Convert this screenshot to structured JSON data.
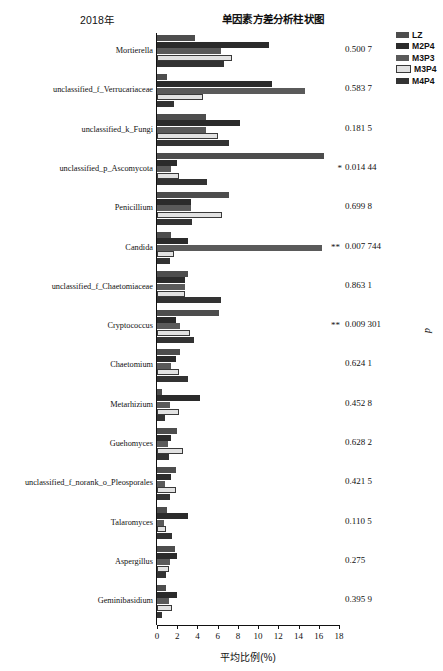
{
  "header": {
    "year": "2018年",
    "title": "单因素方差分析柱状图"
  },
  "legend": {
    "items": [
      {
        "label": "LZ",
        "color": "#4d4d4d"
      },
      {
        "label": "M2P4",
        "color": "#2b2b2b"
      },
      {
        "label": "M3P3",
        "color": "#5a5a5a"
      },
      {
        "label": "M3P4",
        "color": "#e2e2e2"
      },
      {
        "label": "M4P4",
        "color": "#333333"
      }
    ]
  },
  "axis": {
    "xlabel": "平均比例(%)",
    "ticks": [
      "0",
      "2",
      "4",
      "6",
      "8",
      "10",
      "12",
      "14",
      "16",
      "18"
    ],
    "p_axis_label": "p"
  },
  "chart_data": {
    "type": "bar",
    "orientation": "horizontal",
    "title": "单因素方差分析柱状图",
    "subtitle": "2018年",
    "xlabel": "平均比例(%)",
    "ylabel": "",
    "xlim": [
      0,
      18
    ],
    "grid": false,
    "legend_position": "top-right",
    "categories": [
      "Mortierella",
      "unclassified_f_Verrucariaceae",
      "unclassified_k_Fungi",
      "unclassified_p_Ascomycota",
      "Penicillium",
      "Candida",
      "unclassified_f_Chaetomiaceae",
      "Cryptococcus",
      "Chaetomium",
      "Metarhizium",
      "Guehomyces",
      "unclassified_f_norank_o_Pleosporales",
      "Talaromyces",
      "Aspergillus",
      "Geminibasidium"
    ],
    "series": [
      {
        "name": "LZ",
        "values": [
          3.8,
          1.0,
          4.8,
          16.5,
          7.1,
          1.4,
          3.1,
          6.1,
          2.3,
          0.5,
          2.0,
          1.9,
          1.0,
          1.8,
          0.9
        ]
      },
      {
        "name": "M2P4",
        "values": [
          11.1,
          11.4,
          8.2,
          2.0,
          3.4,
          3.1,
          2.8,
          1.9,
          1.9,
          4.3,
          1.4,
          1.4,
          3.1,
          2.0,
          2.0
        ]
      },
      {
        "name": "M3P3",
        "values": [
          6.3,
          14.6,
          4.8,
          1.4,
          3.4,
          16.3,
          2.8,
          2.3,
          1.4,
          1.3,
          1.1,
          0.8,
          0.7,
          1.3,
          1.2
        ]
      },
      {
        "name": "M3P4",
        "values": [
          7.4,
          4.5,
          6.0,
          2.2,
          6.4,
          1.7,
          2.8,
          3.3,
          2.2,
          2.2,
          2.6,
          1.9,
          0.9,
          1.2,
          1.5
        ]
      },
      {
        "name": "M4P4",
        "values": [
          6.6,
          1.7,
          7.1,
          4.9,
          3.5,
          1.3,
          6.3,
          3.7,
          3.1,
          0.8,
          1.2,
          1.3,
          1.5,
          0.9,
          0.5
        ]
      }
    ],
    "p_values": [
      "0.500 7",
      "0.583 7",
      "0.181 5",
      "0.014 44",
      "0.699 8",
      "0.007 744",
      "0.863 1",
      "0.009 301",
      "0.624 1",
      "0.452 8",
      "0.628 2",
      "0.421 5",
      "0.110 5",
      "0.275",
      "0.395 9"
    ],
    "significance": [
      "",
      "",
      "",
      "*",
      "",
      "**",
      "",
      "**",
      "",
      "",
      "",
      "",
      "",
      "",
      ""
    ]
  }
}
